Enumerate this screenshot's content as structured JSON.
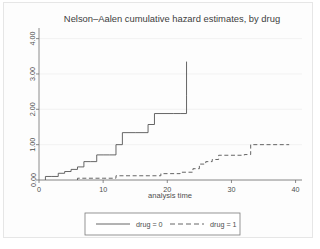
{
  "chart_data": {
    "type": "line",
    "subtype": "step",
    "title": "Nelson–Aalen cumulative hazard estimates, by drug",
    "xlabel": "analysis time",
    "ylabel": "",
    "xlim": [
      0,
      41
    ],
    "ylim": [
      0,
      4.3
    ],
    "xticks": [
      0,
      10,
      20,
      30,
      40
    ],
    "xtick_labels": [
      "0",
      "10",
      "20",
      "30",
      "40"
    ],
    "yticks": [
      0.0,
      1.0,
      2.0,
      3.0,
      4.0
    ],
    "ytick_labels": [
      "0.00",
      "1.00",
      "2.00",
      "3.00",
      "4.00"
    ],
    "grid": "horizontal",
    "legend_position": "bottom",
    "series": [
      {
        "name": "drug = 0",
        "linestyle": "solid",
        "color": "#555555",
        "x": [
          1,
          1,
          2,
          3,
          4,
          5,
          6,
          7,
          8,
          9,
          10,
          11,
          12,
          13,
          15,
          17,
          18,
          21,
          22,
          23,
          23
        ],
        "y": [
          0.0,
          0.1,
          0.1,
          0.19,
          0.24,
          0.3,
          0.37,
          0.52,
          0.52,
          0.71,
          0.71,
          0.71,
          1.0,
          1.34,
          1.34,
          1.57,
          1.88,
          1.88,
          1.88,
          2.38,
          3.35
        ],
        "steps": [
          {
            "t": 1,
            "hazard": 0.1
          },
          {
            "t": 3,
            "hazard": 0.19
          },
          {
            "t": 4,
            "hazard": 0.24
          },
          {
            "t": 5,
            "hazard": 0.3
          },
          {
            "t": 6,
            "hazard": 0.37
          },
          {
            "t": 7,
            "hazard": 0.52
          },
          {
            "t": 9,
            "hazard": 0.71
          },
          {
            "t": 12,
            "hazard": 1.0
          },
          {
            "t": 13,
            "hazard": 1.34
          },
          {
            "t": 15,
            "hazard": 1.57
          },
          {
            "t": 17,
            "hazard": 1.88
          },
          {
            "t": 22,
            "hazard": 2.38
          },
          {
            "t": 23,
            "hazard": 3.35
          }
        ]
      },
      {
        "name": "drug = 1",
        "linestyle": "dashed",
        "color": "#555555",
        "x": [
          6,
          6,
          10,
          12,
          17,
          19,
          22,
          24,
          25,
          26,
          27,
          28,
          32,
          33,
          33,
          39
        ],
        "y": [
          0.0,
          0.05,
          0.05,
          0.12,
          0.12,
          0.18,
          0.22,
          0.32,
          0.45,
          0.52,
          0.58,
          0.7,
          0.72,
          0.72,
          1.0,
          1.0
        ],
        "steps": [
          {
            "t": 6,
            "hazard": 0.05
          },
          {
            "t": 10,
            "hazard": 0.09
          },
          {
            "t": 12,
            "hazard": 0.12
          },
          {
            "t": 19,
            "hazard": 0.18
          },
          {
            "t": 22,
            "hazard": 0.22
          },
          {
            "t": 24,
            "hazard": 0.32
          },
          {
            "t": 25,
            "hazard": 0.45
          },
          {
            "t": 26,
            "hazard": 0.52
          },
          {
            "t": 27,
            "hazard": 0.58
          },
          {
            "t": 28,
            "hazard": 0.7
          },
          {
            "t": 32,
            "hazard": 0.72
          },
          {
            "t": 33,
            "hazard": 1.0
          },
          {
            "t": 39,
            "hazard": 1.0
          }
        ]
      }
    ]
  },
  "legend": {
    "entries": [
      {
        "label": "drug = 0",
        "style": "solid"
      },
      {
        "label": "drug = 1",
        "style": "dashed"
      }
    ]
  },
  "colors": {
    "line": "#555555",
    "axis": "#6e6e6e",
    "grid": "#f0f0f0",
    "text": "#4d4d4d",
    "background": "#ffffff",
    "frame": "#e6e6e6"
  }
}
